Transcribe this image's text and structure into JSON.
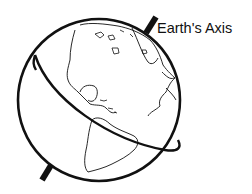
{
  "diagram": {
    "labels": {
      "axis": "Earth's Axis"
    },
    "colors": {
      "stroke": "#111111",
      "background": "#ffffff"
    }
  }
}
